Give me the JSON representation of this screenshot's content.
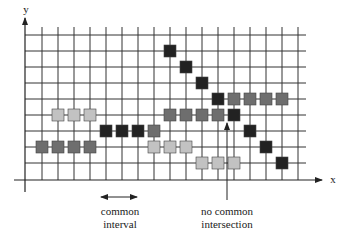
{
  "axes": {
    "x_label": "x",
    "y_label": "y"
  },
  "grid": {
    "x0": 42,
    "y0": 35,
    "step": 16,
    "cols": 17,
    "rows": 9,
    "axis_x": 25,
    "axis_y": 180
  },
  "colors": {
    "black": "#222222",
    "dark_gray": "#6e6e6e",
    "light_gray": "#c2c2c2",
    "grid": "#333333"
  },
  "squares": [
    {
      "i": 8,
      "j": 1,
      "c": "black"
    },
    {
      "i": 9,
      "j": 2,
      "c": "black"
    },
    {
      "i": 10,
      "j": 3,
      "c": "black"
    },
    {
      "i": 11,
      "j": 4,
      "c": "black"
    },
    {
      "i": 12,
      "j": 4,
      "c": "dark_gray"
    },
    {
      "i": 13,
      "j": 4,
      "c": "dark_gray"
    },
    {
      "i": 14,
      "j": 4,
      "c": "dark_gray"
    },
    {
      "i": 15,
      "j": 4,
      "c": "dark_gray"
    },
    {
      "i": 1,
      "j": 5,
      "c": "light_gray"
    },
    {
      "i": 2,
      "j": 5,
      "c": "light_gray"
    },
    {
      "i": 3,
      "j": 5,
      "c": "light_gray"
    },
    {
      "i": 8,
      "j": 5,
      "c": "dark_gray"
    },
    {
      "i": 9,
      "j": 5,
      "c": "dark_gray"
    },
    {
      "i": 10,
      "j": 5,
      "c": "dark_gray"
    },
    {
      "i": 11,
      "j": 5,
      "c": "dark_gray"
    },
    {
      "i": 12,
      "j": 5,
      "c": "black"
    },
    {
      "i": 4,
      "j": 6,
      "c": "black"
    },
    {
      "i": 5,
      "j": 6,
      "c": "black"
    },
    {
      "i": 6,
      "j": 6,
      "c": "black"
    },
    {
      "i": 7,
      "j": 6,
      "c": "dark_gray"
    },
    {
      "i": 13,
      "j": 6,
      "c": "black"
    },
    {
      "i": 0,
      "j": 7,
      "c": "dark_gray"
    },
    {
      "i": 1,
      "j": 7,
      "c": "dark_gray"
    },
    {
      "i": 2,
      "j": 7,
      "c": "dark_gray"
    },
    {
      "i": 3,
      "j": 7,
      "c": "dark_gray"
    },
    {
      "i": 7,
      "j": 7,
      "c": "light_gray"
    },
    {
      "i": 8,
      "j": 7,
      "c": "light_gray"
    },
    {
      "i": 9,
      "j": 7,
      "c": "light_gray"
    },
    {
      "i": 14,
      "j": 7,
      "c": "black"
    },
    {
      "i": 10,
      "j": 8,
      "c": "light_gray"
    },
    {
      "i": 11,
      "j": 8,
      "c": "light_gray"
    },
    {
      "i": 12,
      "j": 8,
      "c": "light_gray"
    },
    {
      "i": 15,
      "j": 8,
      "c": "black"
    }
  ],
  "annotations": {
    "common_interval": {
      "line1": "common",
      "line2": "interval"
    },
    "no_common_intersection": {
      "line1": "no common",
      "line2": "intersection"
    }
  }
}
